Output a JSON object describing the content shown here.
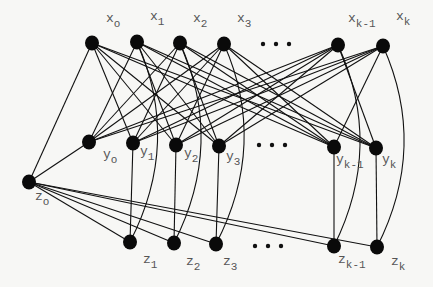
{
  "diagram": {
    "type": "graph",
    "nodes": [
      {
        "id": "xo",
        "base": "x",
        "sub": "o",
        "x": 92,
        "y": 43
      },
      {
        "id": "x1",
        "base": "x",
        "sub": "1",
        "x": 137,
        "y": 42
      },
      {
        "id": "x2",
        "base": "x",
        "sub": "2",
        "x": 180,
        "y": 43
      },
      {
        "id": "x3",
        "base": "x",
        "sub": "3",
        "x": 224,
        "y": 44
      },
      {
        "id": "xk1",
        "base": "x",
        "sub": "k-1",
        "x": 338,
        "y": 45
      },
      {
        "id": "xk",
        "base": "x",
        "sub": "k",
        "x": 383,
        "y": 46
      },
      {
        "id": "yo",
        "base": "y",
        "sub": "o",
        "x": 89,
        "y": 142
      },
      {
        "id": "y1",
        "base": "y",
        "sub": "1",
        "x": 133,
        "y": 143
      },
      {
        "id": "y2",
        "base": "y",
        "sub": "2",
        "x": 176,
        "y": 145
      },
      {
        "id": "y3",
        "base": "y",
        "sub": "3",
        "x": 219,
        "y": 146
      },
      {
        "id": "yk1",
        "base": "y",
        "sub": "k-1",
        "x": 334,
        "y": 147
      },
      {
        "id": "yk",
        "base": "y",
        "sub": "k",
        "x": 376,
        "y": 148
      },
      {
        "id": "zo",
        "base": "z",
        "sub": "o",
        "x": 29,
        "y": 182
      },
      {
        "id": "z1",
        "base": "z",
        "sub": "1",
        "x": 130,
        "y": 242
      },
      {
        "id": "z2",
        "base": "z",
        "sub": "2",
        "x": 174,
        "y": 243
      },
      {
        "id": "z3",
        "base": "z",
        "sub": "3",
        "x": 216,
        "y": 244
      },
      {
        "id": "zk1",
        "base": "z",
        "sub": "k-1",
        "x": 334,
        "y": 246
      },
      {
        "id": "zk",
        "base": "z",
        "sub": "k",
        "x": 377,
        "y": 247
      }
    ],
    "labels": {
      "xo": {
        "base": "x",
        "sub": "o"
      },
      "x1": {
        "base": "x",
        "sub": "1"
      },
      "x2": {
        "base": "x",
        "sub": "2"
      },
      "x3": {
        "base": "x",
        "sub": "3"
      },
      "xk1": {
        "base": "x",
        "sub": "k-1"
      },
      "xk": {
        "base": "x",
        "sub": "k"
      },
      "yo": {
        "base": "y",
        "sub": "o"
      },
      "y1": {
        "base": "y",
        "sub": "1"
      },
      "y2": {
        "base": "y",
        "sub": "2"
      },
      "y3": {
        "base": "y",
        "sub": "3"
      },
      "yk1": {
        "base": "y",
        "sub": "k-1"
      },
      "yk": {
        "base": "y",
        "sub": "k"
      },
      "zo": {
        "base": "z",
        "sub": "o"
      },
      "z1": {
        "base": "z",
        "sub": "1"
      },
      "z2": {
        "base": "z",
        "sub": "2"
      },
      "z3": {
        "base": "z",
        "sub": "3"
      },
      "zk1": {
        "base": "z",
        "sub": "k-1"
      },
      "zk": {
        "base": "z",
        "sub": "k"
      }
    },
    "ellipses": [
      "…",
      "…",
      "…"
    ],
    "edges": {
      "x_to_y": "complete bipartite except x_i to y_i",
      "x_i_to_y_i": "none",
      "x_i_to_z_i": "curved arc for i >= 1",
      "y_i_to_z_i": "vertical straight line for i >= 1",
      "z_o_to_x_o": "straight",
      "z_o_to_y_o": "straight",
      "z_o_to_z_i": "straight for all i >= 1"
    }
  }
}
